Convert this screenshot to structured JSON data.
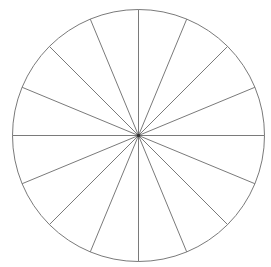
{
  "diagram": {
    "type": "segmented-circle",
    "center": {
      "x": 138.5,
      "y": 135.5
    },
    "radius": 126,
    "segments": 16,
    "segment_angle_deg": 22.5,
    "start_angle_deg": 0,
    "stroke_color": "#7a7a7a",
    "stroke_width": 1,
    "center_dot_color": "#333333",
    "center_dot_radius": 1.8,
    "background": "#ffffff"
  }
}
